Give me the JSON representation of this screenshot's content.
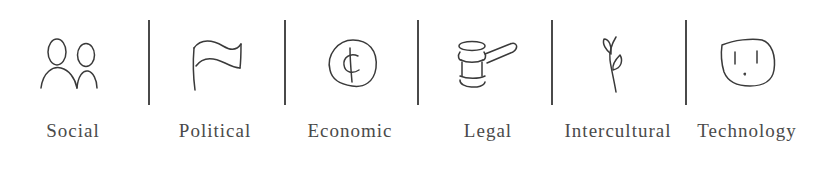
{
  "diagram": {
    "categories": [
      {
        "id": "social",
        "label": "Social",
        "icon": "two-people-icon"
      },
      {
        "id": "political",
        "label": "Political",
        "icon": "flag-icon"
      },
      {
        "id": "economic",
        "label": "Economic",
        "icon": "cent-coin-icon"
      },
      {
        "id": "legal",
        "label": "Legal",
        "icon": "gavel-icon"
      },
      {
        "id": "intercultural",
        "label": "Intercultural",
        "icon": "sprout-icon"
      },
      {
        "id": "technology",
        "label": "Technology",
        "icon": "power-outlet-icon"
      }
    ],
    "colors": {
      "stroke": "#3a3a3a",
      "text": "#4a4a4a",
      "background": "#ffffff"
    }
  }
}
